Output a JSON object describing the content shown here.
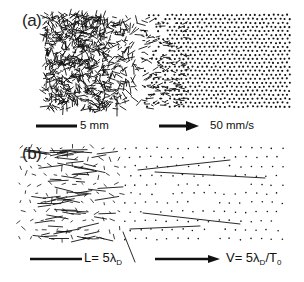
{
  "figure": {
    "panel_a": {
      "label": "(a)",
      "description": "Experimental particle velocity field: disordered (melted) region on left, crystalline lattice on right",
      "scale_length_label": "5 mm",
      "scale_velocity_label": "50 mm/s",
      "disordered_region": {
        "x0": 45,
        "x1": 150,
        "y0": 15,
        "y1": 110,
        "count": 900,
        "seed": 7
      },
      "crystal_region": {
        "x0": 140,
        "x1": 290,
        "y0": 15,
        "y1": 108,
        "spacing": 4.6,
        "seed": 11
      }
    },
    "panel_b": {
      "label": "(b)",
      "description": "Simulated particle displacement vectors with scaled length and velocity markers",
      "scale_length_prefix": "L= 5λ",
      "scale_length_sub": "D",
      "scale_velocity_prefix": "V= 5λ",
      "scale_velocity_sub1": "D",
      "scale_velocity_mid": "/T",
      "scale_velocity_sub2": "0",
      "dense_region": {
        "x0": 45,
        "x1": 100,
        "y0": 148,
        "y1": 242,
        "count": 70,
        "seed": 3
      },
      "sparse_region": {
        "x0": 20,
        "x1": 285,
        "y0": 148,
        "y1": 242,
        "spacing": 10.5,
        "seed": 5
      },
      "long_vectors": [
        [
          138,
          170,
          230,
          160
        ],
        [
          155,
          172,
          265,
          178
        ],
        [
          143,
          213,
          240,
          224
        ],
        [
          130,
          229,
          200,
          226
        ],
        [
          123,
          232,
          135,
          262
        ]
      ]
    },
    "colors": {
      "ink": "#111111",
      "background": "#ffffff"
    }
  }
}
